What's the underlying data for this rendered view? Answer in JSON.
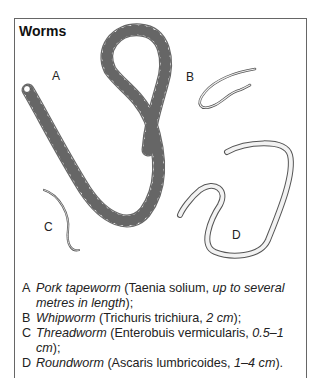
{
  "title": "Worms",
  "figure_labels": {
    "A": "A",
    "B": "B",
    "C": "C",
    "D": "D"
  },
  "legend": [
    {
      "key": "A",
      "common": "Pork tapeworm",
      "open": " (Taenia solium, ",
      "detail": "up to several metres in length",
      "close": ");"
    },
    {
      "key": "B",
      "common": "Whipworm",
      "open": " (Trichuris trichiura, ",
      "detail": "2 cm",
      "close": ");"
    },
    {
      "key": "C",
      "common": "Threadworm",
      "open": " (Enterobuis vermicularis, ",
      "detail": "0.5–1 cm",
      "close": ");"
    },
    {
      "key": "D",
      "common": "Roundworm",
      "open": " (Ascaris lumbricoides, ",
      "detail": "1–4 cm",
      "close": ")."
    }
  ],
  "colors": {
    "border": "#666666",
    "outline": "#555555",
    "fill": "#f2f2f2"
  }
}
